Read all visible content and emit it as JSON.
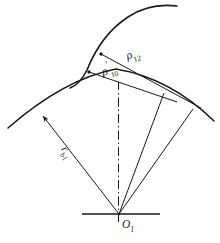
{
  "figure": {
    "type": "engineering-geometry-diagram",
    "background_color": "#ffffff",
    "line_color": "#1a1a1a"
  },
  "labels": {
    "rho_12": {
      "base": "ρ",
      "prime": "",
      "sub": "12"
    },
    "rho_10_prime": {
      "base": "ρ",
      "prime": "′",
      "sub": "10"
    },
    "r_b1": {
      "base": "r",
      "prime": "",
      "sub": "b1"
    },
    "o_1": {
      "base": "O",
      "prime": "",
      "sub": "1"
    }
  },
  "geometry": {
    "center": {
      "x": 119,
      "y": 214,
      "name": "O1"
    },
    "base_arc": {
      "start": {
        "x": 8,
        "y": 128
      },
      "control": {
        "x": 115,
        "y": 68
      },
      "end": {
        "x": 214,
        "y": 120
      }
    },
    "upper_curve": {
      "start": {
        "x": 70,
        "y": 88
      },
      "end": {
        "x": 176,
        "y": 6
      }
    },
    "rays": [
      {
        "name": "radius-rb1",
        "from": {
          "x": 119,
          "y": 214
        },
        "to": {
          "x": 40,
          "y": 113
        },
        "arrow": true
      },
      {
        "name": "ray-center-vertical",
        "from": {
          "x": 119,
          "y": 214
        },
        "to": {
          "x": 118,
          "y": 84
        },
        "dashdot": true
      },
      {
        "name": "ray-right-inner",
        "from": {
          "x": 119,
          "y": 214
        },
        "to": {
          "x": 164,
          "y": 94
        }
      },
      {
        "name": "ray-right-outer",
        "from": {
          "x": 119,
          "y": 214
        },
        "to": {
          "x": 192,
          "y": 110
        }
      }
    ],
    "chords": [
      {
        "name": "chord-rho-12",
        "from": {
          "x": 102,
          "y": 54
        },
        "to": {
          "x": 200,
          "y": 107
        }
      },
      {
        "name": "chord-rho-10",
        "from": {
          "x": 90,
          "y": 72
        },
        "to": {
          "x": 176,
          "y": 101
        }
      }
    ],
    "tangent_points": [
      {
        "x": 102,
        "y": 54
      },
      {
        "x": 90,
        "y": 72
      }
    ],
    "horizontal_axis": {
      "from": {
        "x": 82,
        "y": 214
      },
      "to": {
        "x": 161,
        "y": 214
      }
    }
  }
}
